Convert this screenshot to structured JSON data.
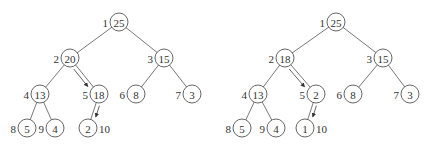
{
  "figure": {
    "colors": {
      "stroke": "#555555",
      "text": "#333333",
      "background": "#ffffff"
    }
  },
  "trees": [
    {
      "name": "before",
      "nodes": [
        {
          "index": "1",
          "value": "25",
          "x": 119,
          "y": 22,
          "label_side": "left"
        },
        {
          "index": "2",
          "value": "20",
          "x": 70,
          "y": 58,
          "label_side": "left"
        },
        {
          "index": "3",
          "value": "15",
          "x": 164,
          "y": 58,
          "label_side": "left"
        },
        {
          "index": "4",
          "value": "13",
          "x": 40,
          "y": 94,
          "label_side": "left"
        },
        {
          "index": "5",
          "value": "18",
          "x": 99,
          "y": 94,
          "label_side": "left"
        },
        {
          "index": "6",
          "value": "8",
          "x": 136,
          "y": 94,
          "label_side": "left"
        },
        {
          "index": "7",
          "value": "3",
          "x": 192,
          "y": 94,
          "label_side": "left"
        },
        {
          "index": "8",
          "value": "5",
          "x": 27,
          "y": 128,
          "label_side": "left"
        },
        {
          "index": "9",
          "value": "4",
          "x": 55,
          "y": 128,
          "label_side": "left"
        },
        {
          "index": "10",
          "value": "2",
          "x": 88,
          "y": 128,
          "label_side": "right"
        }
      ],
      "arrows": [
        [
          "2",
          "5"
        ],
        [
          "5",
          "10"
        ]
      ]
    },
    {
      "name": "after",
      "nodes": [
        {
          "index": "1",
          "value": "25",
          "x": 336,
          "y": 22,
          "label_side": "left"
        },
        {
          "index": "2",
          "value": "18",
          "x": 285,
          "y": 58,
          "label_side": "left"
        },
        {
          "index": "3",
          "value": "15",
          "x": 383,
          "y": 58,
          "label_side": "left"
        },
        {
          "index": "4",
          "value": "13",
          "x": 258,
          "y": 94,
          "label_side": "left"
        },
        {
          "index": "5",
          "value": "2",
          "x": 316,
          "y": 94,
          "label_side": "left"
        },
        {
          "index": "6",
          "value": "8",
          "x": 353,
          "y": 94,
          "label_side": "left"
        },
        {
          "index": "7",
          "value": "3",
          "x": 410,
          "y": 94,
          "label_side": "left"
        },
        {
          "index": "8",
          "value": "5",
          "x": 242,
          "y": 128,
          "label_side": "left"
        },
        {
          "index": "9",
          "value": "4",
          "x": 276,
          "y": 128,
          "label_side": "left"
        },
        {
          "index": "10",
          "value": "1",
          "x": 305,
          "y": 128,
          "label_side": "right"
        }
      ],
      "arrows": [
        [
          "2",
          "5"
        ],
        [
          "5",
          "10"
        ]
      ]
    }
  ],
  "edges": [
    [
      "1",
      "2"
    ],
    [
      "1",
      "3"
    ],
    [
      "2",
      "4"
    ],
    [
      "2",
      "5"
    ],
    [
      "3",
      "6"
    ],
    [
      "3",
      "7"
    ],
    [
      "4",
      "8"
    ],
    [
      "4",
      "9"
    ],
    [
      "5",
      "10"
    ]
  ],
  "node_radius": 9
}
